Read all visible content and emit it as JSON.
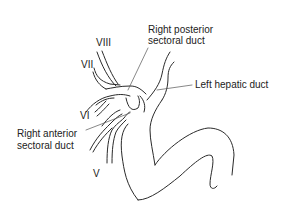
{
  "diagram": {
    "labels": {
      "segment_viii": "VIII",
      "segment_vii": "VII",
      "segment_vi": "VI",
      "segment_v": "V",
      "right_posterior_1": "Right posterior",
      "right_posterior_2": "sectoral duct",
      "left_hepatic": "Left hepatic duct",
      "right_anterior_1": "Right anterior",
      "right_anterior_2": "sectoral duct"
    }
  }
}
